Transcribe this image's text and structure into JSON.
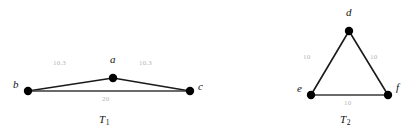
{
  "figure": {
    "background_color": "#ffffff",
    "vertex_color": "#000000",
    "edge_color": "#1a1a1a",
    "edge_label_color": "#b4b4b4",
    "vertex_label_color": "#111111"
  },
  "graphs": [
    {
      "id": "T1",
      "caption_base": "T",
      "caption_sub": "1",
      "caption_x": 104,
      "caption_y": 120,
      "vertices": [
        {
          "name": "a",
          "label": "a",
          "cx": 113,
          "cy": 78,
          "r": 4.2,
          "label_x": 110,
          "label_y": 60
        },
        {
          "name": "b",
          "label": "b",
          "cx": 28,
          "cy": 91,
          "r": 4.2,
          "label_x": 14,
          "label_y": 85
        },
        {
          "name": "c",
          "label": "c",
          "cx": 190,
          "cy": 91,
          "r": 4.2,
          "label_x": 198,
          "label_y": 86
        }
      ],
      "edges": [
        {
          "name": "edge-b-a",
          "from": "b",
          "to": "a",
          "weight": "10.3",
          "label_x": 56,
          "label_y": 64
        },
        {
          "name": "edge-a-c",
          "from": "a",
          "to": "c",
          "weight": "10.3",
          "label_x": 142,
          "label_y": 64
        },
        {
          "name": "edge-b-c",
          "from": "b",
          "to": "c",
          "weight": "20",
          "label_x": 104,
          "label_y": 99
        }
      ]
    },
    {
      "id": "T2",
      "caption_base": "T",
      "caption_sub": "2",
      "caption_x": 345,
      "caption_y": 120,
      "vertices": [
        {
          "name": "d",
          "label": "d",
          "cx": 349,
          "cy": 31,
          "r": 4.2,
          "label_x": 346,
          "label_y": 13
        },
        {
          "name": "e",
          "label": "e",
          "cx": 311,
          "cy": 95,
          "r": 4.2,
          "label_x": 297,
          "label_y": 89
        },
        {
          "name": "f",
          "label": "f",
          "cx": 388,
          "cy": 95,
          "r": 4.2,
          "label_x": 396,
          "label_y": 88
        }
      ],
      "edges": [
        {
          "name": "edge-e-d",
          "from": "e",
          "to": "d",
          "weight": "10",
          "label_x": 303,
          "label_y": 58
        },
        {
          "name": "edge-d-f",
          "from": "d",
          "to": "f",
          "weight": "10",
          "label_x": 370,
          "label_y": 58
        },
        {
          "name": "edge-e-f",
          "from": "e",
          "to": "f",
          "weight": "10",
          "label_x": 344,
          "label_y": 103
        }
      ]
    }
  ]
}
